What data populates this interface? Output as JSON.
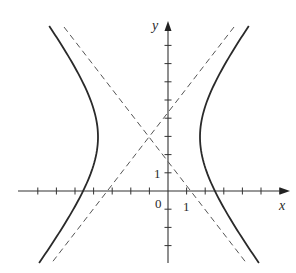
{
  "figure": {
    "type": "hyperbola-graph",
    "axes": {
      "x_label": "x",
      "y_label": "y",
      "origin_label": "0",
      "x_unit_label": "1",
      "y_unit_label": "1",
      "x_ticks": [
        -7,
        -6,
        -5,
        -4,
        -3,
        -2,
        -1,
        1,
        2,
        3,
        4,
        5,
        6,
        7
      ],
      "y_ticks": [
        -3,
        -2,
        -1,
        1,
        2,
        3,
        4,
        5,
        6,
        7,
        8
      ],
      "x_range": [
        -7.2,
        6.3
      ],
      "y_range": [
        -4,
        9.3
      ]
    },
    "hyperbola": {
      "orientation": "horizontal",
      "center": [
        -1,
        3
      ],
      "approx_vertices": [
        [
          -3.7,
          3
        ],
        [
          1.7,
          3
        ]
      ],
      "branches": [
        "left",
        "right"
      ],
      "stroke": "#2a2a2a"
    },
    "asymptotes": {
      "style": "dashed",
      "intersection": [
        -1,
        3
      ],
      "lines": [
        {
          "name": "rising",
          "y_intercept": 4.25
        },
        {
          "name": "falling",
          "y_intercept": 1.75
        }
      ],
      "stroke": "#555555"
    }
  },
  "pixel_map": {
    "origin": [
      168,
      191
    ],
    "x_unit_px": 18.6,
    "y_unit_px": 18.2,
    "center_px": [
      149,
      137
    ],
    "a_px": 51,
    "b_px": 66,
    "top_y_px": 26,
    "bottom_y_px": 263
  }
}
